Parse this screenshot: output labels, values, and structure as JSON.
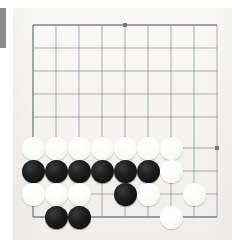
{
  "scene": {
    "title": "Go board diagram",
    "subject": "go-board-position"
  },
  "board": {
    "background_color": "#f2f1ef",
    "line_color": "#6d6f74",
    "edge_bar_color": "#8d8d8d",
    "black_stone_color": "#141414",
    "white_stone_color": "#fbfbfa",
    "grid_spacing": 23,
    "stone_diameter": 23,
    "origin_x": 33,
    "origin_y": 25,
    "columns": 9,
    "rows": 9,
    "visible_edges": [
      "left",
      "bottom"
    ],
    "column_x": [
      33,
      56,
      79,
      102,
      125,
      148,
      171,
      194,
      217
    ],
    "row_y": [
      25,
      48,
      71,
      94,
      117,
      140,
      148,
      171,
      194,
      217
    ],
    "line_x": [
      33,
      56,
      79,
      102,
      125,
      148,
      171,
      194,
      217
    ],
    "line_y": [
      25,
      48,
      71,
      94,
      117,
      125,
      148,
      171,
      194,
      217
    ],
    "star_points": [
      {
        "x": 125,
        "y": 25
      },
      {
        "x": 217,
        "y": 148
      }
    ]
  },
  "stones": [
    {
      "color": "white",
      "cx": 33,
      "cy": 148,
      "label": "w-r1-c1"
    },
    {
      "color": "white",
      "cx": 56,
      "cy": 148,
      "label": "w-r1-c2"
    },
    {
      "color": "white",
      "cx": 79,
      "cy": 148,
      "label": "w-r1-c3"
    },
    {
      "color": "white",
      "cx": 102,
      "cy": 148,
      "label": "w-r1-c4"
    },
    {
      "color": "white",
      "cx": 125,
      "cy": 148,
      "label": "w-r1-c5"
    },
    {
      "color": "white",
      "cx": 148,
      "cy": 148,
      "label": "w-r1-c6"
    },
    {
      "color": "white",
      "cx": 171,
      "cy": 148,
      "label": "w-r1-c7"
    },
    {
      "color": "black",
      "cx": 33,
      "cy": 171,
      "label": "b-r2-c1"
    },
    {
      "color": "black",
      "cx": 56,
      "cy": 171,
      "label": "b-r2-c2"
    },
    {
      "color": "black",
      "cx": 79,
      "cy": 171,
      "label": "b-r2-c3"
    },
    {
      "color": "black",
      "cx": 102,
      "cy": 171,
      "label": "b-r2-c4"
    },
    {
      "color": "black",
      "cx": 125,
      "cy": 171,
      "label": "b-r2-c5"
    },
    {
      "color": "black",
      "cx": 148,
      "cy": 171,
      "label": "b-r2-c6"
    },
    {
      "color": "white",
      "cx": 171,
      "cy": 171,
      "label": "w-r2-c7"
    },
    {
      "color": "white",
      "cx": 33,
      "cy": 194,
      "label": "w-r3-c1"
    },
    {
      "color": "white",
      "cx": 56,
      "cy": 194,
      "label": "w-r3-c2"
    },
    {
      "color": "white",
      "cx": 79,
      "cy": 194,
      "label": "w-r3-c3"
    },
    {
      "color": "black",
      "cx": 125,
      "cy": 194,
      "label": "b-r3-c5"
    },
    {
      "color": "white",
      "cx": 148,
      "cy": 194,
      "label": "w-r3-c6"
    },
    {
      "color": "white",
      "cx": 194,
      "cy": 194,
      "label": "w-r3-c8"
    },
    {
      "color": "black",
      "cx": 56,
      "cy": 217,
      "label": "b-r4-c2"
    },
    {
      "color": "black",
      "cx": 79,
      "cy": 217,
      "label": "b-r4-c3"
    },
    {
      "color": "white",
      "cx": 171,
      "cy": 217,
      "label": "w-r4-c7"
    }
  ]
}
